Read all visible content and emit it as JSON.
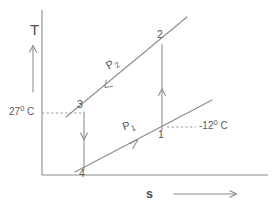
{
  "figure": {
    "type": "T-s thermodynamic process diagram",
    "background_color": "#ffffff",
    "line_color": "#8a8a8a",
    "text_color": "#555555"
  },
  "axes": {
    "y_label": "T",
    "x_label": "s",
    "y_arrow_icon": "up-arrow-icon",
    "x_arrow_icon": "right-arrow-icon",
    "origin_px": [
      42,
      175
    ],
    "y_axis_top_px": [
      42,
      10
    ],
    "x_axis_right_px": [
      268,
      175
    ]
  },
  "temperature_labels": [
    {
      "id": "t-high",
      "value": "27",
      "degree": "0",
      "unit": "C",
      "text": "27⁰ C",
      "attached_to_state": "3",
      "leader_style": "dashed-horizontal-left"
    },
    {
      "id": "t-low",
      "value": "-12",
      "degree": "0",
      "unit": "C",
      "text": "-12⁰ C",
      "attached_to_state": "1",
      "leader_style": "dashed-horizontal-right"
    }
  ],
  "pressure_lines": [
    {
      "id": "p2",
      "label": "P",
      "subscript": "2",
      "text": "P₂",
      "description": "upper constant-pressure line through states 3 and 2",
      "arrow_direction": "down-left",
      "start_px": [
        66,
        117
      ],
      "end_px": [
        187,
        17
      ]
    },
    {
      "id": "p1",
      "label": "P",
      "subscript": "1",
      "text": "P₁",
      "description": "lower constant-pressure line through states 4 and 1",
      "arrow_direction": "up-right",
      "start_px": [
        75,
        172
      ],
      "end_px": [
        212,
        100
      ]
    }
  ],
  "states": [
    {
      "id": "1",
      "label": "1",
      "px": [
        162,
        130
      ],
      "on_line": "p1"
    },
    {
      "id": "2",
      "label": "2",
      "px": [
        162,
        42
      ],
      "on_line": "p2"
    },
    {
      "id": "3",
      "label": "3",
      "px": [
        84,
        113
      ],
      "on_line": "p2"
    },
    {
      "id": "4",
      "label": "4",
      "px": [
        84,
        168
      ],
      "on_line": "p1"
    }
  ],
  "processes": [
    {
      "id": "1-2",
      "from": "1",
      "to": "2",
      "direction": "up",
      "kind": "vertical",
      "description": "compression from state 1 to state 2"
    },
    {
      "id": "3-4",
      "from": "3",
      "to": "4",
      "direction": "down",
      "kind": "vertical",
      "description": "expansion from state 3 to state 4"
    }
  ]
}
